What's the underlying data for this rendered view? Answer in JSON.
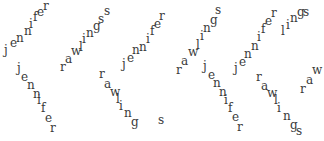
{
  "captcha": {
    "words": [
      "jennifer",
      "rawlings"
    ],
    "text_color": "#3a3a3a",
    "background": "#ffffff",
    "glyphs": [
      {
        "ch": "j",
        "x": 4,
        "y": 44
      },
      {
        "ch": "e",
        "x": 10,
        "y": 37
      },
      {
        "ch": "n",
        "x": 16,
        "y": 32
      },
      {
        "ch": "n",
        "x": 24,
        "y": 25
      },
      {
        "ch": "i",
        "x": 29,
        "y": 18
      },
      {
        "ch": "f",
        "x": 33,
        "y": 11
      },
      {
        "ch": "e",
        "x": 37,
        "y": 6
      },
      {
        "ch": "r",
        "x": 43,
        "y": 0
      },
      {
        "ch": "j",
        "x": 17,
        "y": 62
      },
      {
        "ch": "e",
        "x": 21,
        "y": 71
      },
      {
        "ch": "n",
        "x": 27,
        "y": 79
      },
      {
        "ch": "n",
        "x": 33,
        "y": 88
      },
      {
        "ch": "i",
        "x": 37,
        "y": 94
      },
      {
        "ch": "f",
        "x": 41,
        "y": 102
      },
      {
        "ch": "e",
        "x": 45,
        "y": 112
      },
      {
        "ch": "r",
        "x": 50,
        "y": 122
      },
      {
        "ch": "r",
        "x": 60,
        "y": 61
      },
      {
        "ch": "a",
        "x": 65,
        "y": 53
      },
      {
        "ch": "w",
        "x": 71,
        "y": 45
      },
      {
        "ch": "l",
        "x": 79,
        "y": 41
      },
      {
        "ch": "i",
        "x": 82,
        "y": 33
      },
      {
        "ch": "n",
        "x": 86,
        "y": 27
      },
      {
        "ch": "g",
        "x": 93,
        "y": 20
      },
      {
        "ch": "s",
        "x": 98,
        "y": 13
      },
      {
        "ch": "s",
        "x": 104,
        "y": 5
      },
      {
        "ch": "j",
        "x": 122,
        "y": 58
      },
      {
        "ch": "e",
        "x": 127,
        "y": 52
      },
      {
        "ch": "n",
        "x": 132,
        "y": 44
      },
      {
        "ch": "n",
        "x": 139,
        "y": 41
      },
      {
        "ch": "i",
        "x": 146,
        "y": 33
      },
      {
        "ch": "f",
        "x": 150,
        "y": 25
      },
      {
        "ch": "e",
        "x": 154,
        "y": 18
      },
      {
        "ch": "r",
        "x": 159,
        "y": 10
      },
      {
        "ch": "r",
        "x": 99,
        "y": 68
      },
      {
        "ch": "a",
        "x": 104,
        "y": 78
      },
      {
        "ch": "w",
        "x": 110,
        "y": 86
      },
      {
        "ch": "l",
        "x": 116,
        "y": 93
      },
      {
        "ch": "i",
        "x": 119,
        "y": 100
      },
      {
        "ch": "n",
        "x": 124,
        "y": 107
      },
      {
        "ch": "g",
        "x": 131,
        "y": 116
      },
      {
        "ch": "s",
        "x": 158,
        "y": 114
      },
      {
        "ch": "r",
        "x": 176,
        "y": 64
      },
      {
        "ch": "a",
        "x": 181,
        "y": 55
      },
      {
        "ch": "w",
        "x": 188,
        "y": 46
      },
      {
        "ch": "l",
        "x": 196,
        "y": 39
      },
      {
        "ch": "i",
        "x": 200,
        "y": 30
      },
      {
        "ch": "n",
        "x": 203,
        "y": 22
      },
      {
        "ch": "g",
        "x": 210,
        "y": 14
      },
      {
        "ch": "s",
        "x": 215,
        "y": 4
      },
      {
        "ch": "j",
        "x": 203,
        "y": 60
      },
      {
        "ch": "e",
        "x": 208,
        "y": 69
      },
      {
        "ch": "n",
        "x": 213,
        "y": 77
      },
      {
        "ch": "n",
        "x": 219,
        "y": 86
      },
      {
        "ch": "i",
        "x": 224,
        "y": 94
      },
      {
        "ch": "f",
        "x": 228,
        "y": 102
      },
      {
        "ch": "e",
        "x": 232,
        "y": 111
      },
      {
        "ch": "r",
        "x": 237,
        "y": 121
      },
      {
        "ch": "j",
        "x": 234,
        "y": 62
      },
      {
        "ch": "e",
        "x": 239,
        "y": 56
      },
      {
        "ch": "n",
        "x": 244,
        "y": 48
      },
      {
        "ch": "n",
        "x": 251,
        "y": 40
      },
      {
        "ch": "i",
        "x": 257,
        "y": 31
      },
      {
        "ch": "f",
        "x": 261,
        "y": 23
      },
      {
        "ch": "e",
        "x": 265,
        "y": 15
      },
      {
        "ch": "r",
        "x": 271,
        "y": 7
      },
      {
        "ch": "r",
        "x": 256,
        "y": 71
      },
      {
        "ch": "a",
        "x": 261,
        "y": 80
      },
      {
        "ch": "w",
        "x": 267,
        "y": 87
      },
      {
        "ch": "l",
        "x": 274,
        "y": 94
      },
      {
        "ch": "i",
        "x": 277,
        "y": 102
      },
      {
        "ch": "n",
        "x": 283,
        "y": 110
      },
      {
        "ch": "g",
        "x": 290,
        "y": 119
      },
      {
        "ch": "s",
        "x": 296,
        "y": 125
      },
      {
        "ch": "l",
        "x": 281,
        "y": 25
      },
      {
        "ch": "i",
        "x": 286,
        "y": 19
      },
      {
        "ch": "n",
        "x": 290,
        "y": 12
      },
      {
        "ch": "g",
        "x": 297,
        "y": 6
      },
      {
        "ch": "s",
        "x": 303,
        "y": 6
      },
      {
        "ch": "r",
        "x": 300,
        "y": 83
      },
      {
        "ch": "a",
        "x": 306,
        "y": 74
      },
      {
        "ch": "w",
        "x": 312,
        "y": 64
      }
    ]
  }
}
